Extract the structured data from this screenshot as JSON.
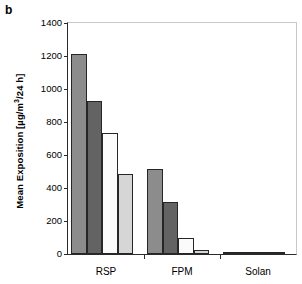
{
  "panel": {
    "letter": "b"
  },
  "axes": {
    "ylabel": "Mean Exposition [µg/m³/24 h]",
    "ylabel_plain": "Mean Exposition [ug/m3/24 h]",
    "yticks": [
      0,
      200,
      400,
      600,
      800,
      1000,
      1200,
      1400
    ],
    "ytick_labels": [
      "0",
      "200",
      "400",
      "600",
      "800",
      "1000",
      "1200",
      "1400"
    ],
    "xlabel": "",
    "categories": [
      "RSP",
      "FPM",
      "Solan"
    ]
  },
  "chart_data": {
    "type": "bar",
    "title": "",
    "subtitle": "",
    "xlabel": "",
    "ylabel": "Mean Exposition [µg/m³/24 h]",
    "categories": [
      "RSP",
      "FPM",
      "Solan"
    ],
    "series": [
      {
        "name": "series-1",
        "color": "#8c8c8c",
        "values": [
          1210,
          515,
          15
        ]
      },
      {
        "name": "series-2",
        "color": "#636363",
        "values": [
          930,
          315,
          12
        ]
      },
      {
        "name": "series-3",
        "color": "#fbfbfb",
        "values": [
          735,
          95,
          3
        ]
      },
      {
        "name": "series-4",
        "color": "#d6d6d6",
        "values": [
          485,
          25,
          2
        ]
      }
    ],
    "ylim": [
      0,
      1400
    ],
    "ytick_step": 200,
    "grid": false,
    "legend": false,
    "annotations": [
      "b"
    ]
  },
  "colors": {
    "axis": "#2b2b2b",
    "frame_light": "#c9c9c9",
    "bar_edge": "#262626",
    "background": "#ffffff"
  }
}
